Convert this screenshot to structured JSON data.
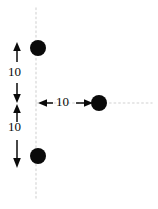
{
  "figure": {
    "width": 158,
    "height": 209,
    "background_color": "#ffffff",
    "ink_color": "#0a0a0a",
    "guide_color": "#e0e0e0"
  },
  "labels": {
    "top_gap": "10",
    "bottom_gap": "10",
    "horizontal_gap": "10"
  },
  "chart_data": {
    "type": "scatter",
    "xlabel": "",
    "ylabel": "",
    "xlim": [
      0,
      158
    ],
    "ylim": [
      209,
      0
    ],
    "grid": false,
    "legend": null,
    "points": [
      {
        "name": "top-charge",
        "x": 38,
        "y": 48,
        "marker": "filled-circle",
        "radius": 8,
        "color": "#0a0a0a"
      },
      {
        "name": "right-charge",
        "x": 99,
        "y": 103,
        "marker": "filled-circle",
        "radius": 8,
        "color": "#0a0a0a"
      },
      {
        "name": "bottom-charge",
        "x": 38,
        "y": 156,
        "marker": "filled-circle",
        "radius": 8,
        "color": "#0a0a0a"
      }
    ],
    "guides": [
      {
        "name": "vertical-axis-guide",
        "orientation": "vertical",
        "x": 36,
        "from": 8,
        "to": 198,
        "style": "dotted",
        "color": "#e0e0e0"
      },
      {
        "name": "horizontal-axis-guide",
        "orientation": "horizontal",
        "y": 103,
        "from": 36,
        "to": 152,
        "style": "dotted",
        "color": "#e0e0e0"
      }
    ],
    "dimensions": [
      {
        "name": "top-vertical-dimension",
        "label": "10",
        "orientation": "vertical",
        "from": [
          17,
          45
        ],
        "to": [
          17,
          102
        ],
        "arrowheads": "both"
      },
      {
        "name": "bottom-vertical-dimension",
        "label": "10",
        "orientation": "vertical",
        "from": [
          17,
          104
        ],
        "to": [
          17,
          167
        ],
        "arrowheads": "both"
      },
      {
        "name": "horizontal-dimension",
        "label": "10",
        "orientation": "horizontal",
        "from": [
          38,
          103
        ],
        "to": [
          93,
          103
        ],
        "arrowheads": "both"
      }
    ]
  }
}
